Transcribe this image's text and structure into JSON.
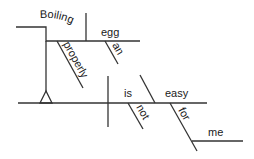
{
  "diagram": {
    "type": "sentence-diagram",
    "sentence_words": {
      "gerund": "Boiling",
      "object": "egg",
      "gerund_modifier": "properly",
      "object_modifier": "an",
      "verb": "is",
      "verb_modifier": "not",
      "complement": "easy",
      "preposition": "for",
      "prep_object": "me"
    },
    "line_color": "#333333",
    "text_color": "#1a1a1a"
  }
}
